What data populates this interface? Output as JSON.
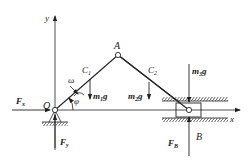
{
  "diagram": {
    "axes": {
      "x_label": "x",
      "y_label": "y"
    },
    "points": {
      "origin": "O",
      "joint": "A",
      "slider": "B"
    },
    "centers": {
      "c1": {
        "base": "C",
        "sub": "1"
      },
      "c2": {
        "base": "C",
        "sub": "2"
      }
    },
    "angular_velocity": "ω",
    "angle": "φ",
    "forces": {
      "fx": {
        "base": "F",
        "sub": "x"
      },
      "fy": {
        "base": "F",
        "sub": "y"
      },
      "fb": {
        "base": "F",
        "sub": "B"
      }
    },
    "weights": {
      "w1": {
        "m": "m",
        "sub": "1",
        "g": "g"
      },
      "w2": {
        "m": "m",
        "sub": "2",
        "g": "g"
      },
      "w3": {
        "m": "m",
        "sub": "3",
        "g": "g"
      }
    },
    "colors": {
      "line": "#222222",
      "background": "#ffffff"
    }
  }
}
